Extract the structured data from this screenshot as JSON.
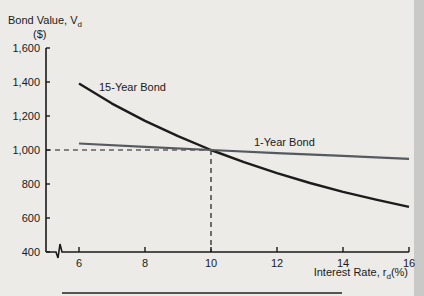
{
  "chart_data": {
    "type": "line",
    "title": "",
    "ylabel": "Bond Value, V",
    "ylabel_sub": "d",
    "ylabel_unit": "($)",
    "xlabel": "Interest Rate, r",
    "xlabel_sub": "d",
    "xlabel_unit": "(%)",
    "xlim": [
      6,
      16
    ],
    "ylim": [
      400,
      1600
    ],
    "x_ticks": [
      6,
      8,
      10,
      12,
      14,
      16
    ],
    "y_ticks": [
      400,
      600,
      800,
      1000,
      1200,
      1400,
      1600
    ],
    "y_tick_labels": [
      "400",
      "600",
      "800",
      "1,000",
      "1,200",
      "1,400",
      "1,600"
    ],
    "axis_break": true,
    "grid": false,
    "reference_point": {
      "x": 10,
      "y": 1000
    },
    "series": [
      {
        "name": "15-Year Bond",
        "x": [
          6,
          7,
          8,
          9,
          10,
          11,
          12,
          13,
          14,
          15,
          16
        ],
        "values": [
          1392,
          1273,
          1171,
          1081,
          1000,
          928,
          864,
          806,
          754,
          708,
          665
        ]
      },
      {
        "name": "1-Year Bond",
        "x": [
          6,
          8,
          10,
          12,
          14,
          16
        ],
        "values": [
          1038,
          1019,
          1000,
          982,
          965,
          948
        ]
      }
    ]
  }
}
